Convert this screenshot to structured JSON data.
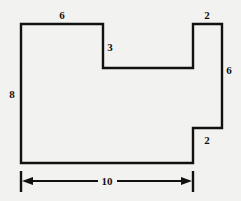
{
  "figure": {
    "kind": "dimensioned-polygon-diagram",
    "background_color": "#f2f2f0",
    "stroke_color": "#111111",
    "fill_color": "none",
    "stroke_width": 2.4,
    "canvas": {
      "width": 241,
      "height": 201
    },
    "outline": {
      "name": "stepped-rectilinear-polygon",
      "points": "21,24 103,24 103,68 193,68 193,24 222,24 222,128 193,128 193,163 21,163",
      "closed": true
    },
    "dimension_line": {
      "name": "overall-width-dimension",
      "y": 181,
      "x_start": 21,
      "x_end": 193,
      "tick_top": 171,
      "tick_bottom": 192,
      "left_arrow_path": "M 21,181 L 193,181",
      "gap_start": 98,
      "gap_end": 117,
      "arrowhead_size": 6
    },
    "labels": [
      {
        "id": "top-width",
        "text": "6",
        "x": 62,
        "y": 15
      },
      {
        "id": "inner-step-drop",
        "text": "3",
        "x": 110,
        "y": 47
      },
      {
        "id": "notch-width",
        "text": "2",
        "x": 207,
        "y": 15
      },
      {
        "id": "right-height",
        "text": "6",
        "x": 229,
        "y": 70
      },
      {
        "id": "left-height",
        "text": "8",
        "x": 12,
        "y": 94
      },
      {
        "id": "lower-step",
        "text": "2",
        "x": 207,
        "y": 140
      },
      {
        "id": "overall-width",
        "text": "10",
        "x": 107,
        "y": 181
      }
    ]
  }
}
